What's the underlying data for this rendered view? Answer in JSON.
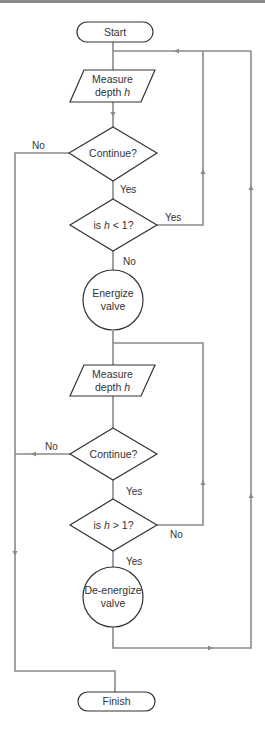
{
  "diagram": {
    "type": "flowchart",
    "nodes": [
      {
        "id": "start",
        "shape": "terminator",
        "label": "Start"
      },
      {
        "id": "measure1",
        "shape": "parallelogram",
        "label_line1": "Measure",
        "label_line2_prefix": "depth ",
        "label_line2_var": "h"
      },
      {
        "id": "continue1",
        "shape": "diamond",
        "label": "Continue?"
      },
      {
        "id": "check_lt",
        "shape": "diamond",
        "label_prefix": "is ",
        "label_var": "h",
        "label_suffix": " < 1?"
      },
      {
        "id": "energize",
        "shape": "circle",
        "label_line1": "Energize",
        "label_line2": "valve"
      },
      {
        "id": "measure2",
        "shape": "parallelogram",
        "label_line1": "Measure",
        "label_line2_prefix": "depth ",
        "label_line2_var": "h"
      },
      {
        "id": "continue2",
        "shape": "diamond",
        "label": "Continue?"
      },
      {
        "id": "check_gt",
        "shape": "diamond",
        "label_prefix": "is ",
        "label_var": "h",
        "label_suffix": " > 1?"
      },
      {
        "id": "deenergize",
        "shape": "circle",
        "label_line1": "De-energize",
        "label_line2": "valve"
      },
      {
        "id": "finish",
        "shape": "terminator",
        "label": "Finish"
      }
    ],
    "edges": [
      {
        "from": "start",
        "to": "measure1",
        "label": ""
      },
      {
        "from": "measure1",
        "to": "continue1",
        "label": ""
      },
      {
        "from": "continue1",
        "to": "finish",
        "label": "No"
      },
      {
        "from": "continue1",
        "to": "check_lt",
        "label": "Yes"
      },
      {
        "from": "check_lt",
        "to": "measure1",
        "label": "Yes"
      },
      {
        "from": "check_lt",
        "to": "energize",
        "label": "No"
      },
      {
        "from": "energize",
        "to": "measure2",
        "label": ""
      },
      {
        "from": "measure2",
        "to": "continue2",
        "label": ""
      },
      {
        "from": "continue2",
        "to": "finish",
        "label": "No"
      },
      {
        "from": "continue2",
        "to": "check_gt",
        "label": "Yes"
      },
      {
        "from": "check_gt",
        "to": "measure2",
        "label": "No"
      },
      {
        "from": "check_gt",
        "to": "deenergize",
        "label": "Yes"
      },
      {
        "from": "deenergize",
        "to": "measure1",
        "label": ""
      }
    ],
    "edge_labels": {
      "continue1_no": "No",
      "continue1_yes": "Yes",
      "check_lt_yes": "Yes",
      "check_lt_no": "No",
      "continue2_no": "No",
      "continue2_yes": "Yes",
      "check_gt_no": "No",
      "check_gt_yes": "Yes"
    },
    "colors": {
      "shape_stroke": "#333333",
      "connector": "#8a8a8a",
      "text": "#333333",
      "background": "#ffffff"
    }
  }
}
